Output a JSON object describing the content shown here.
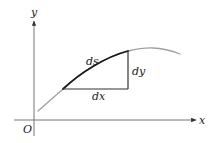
{
  "diagram": {
    "axes": {
      "x_label": "x",
      "y_label": "y",
      "origin_label": "O"
    },
    "labels": {
      "ds": "ds",
      "dx": "dx",
      "dy": "dy"
    },
    "colors": {
      "axis": "#555555",
      "curve": "#9a9a9a",
      "arc_segment": "#1a1a1a",
      "triangle": "#333333",
      "text": "#222222",
      "background": "#ffffff"
    }
  }
}
